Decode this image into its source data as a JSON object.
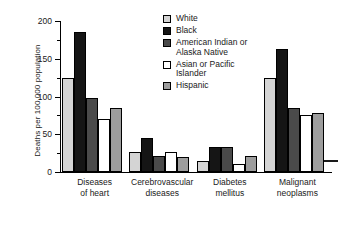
{
  "chart_data": {
    "type": "bar",
    "title": "",
    "xlabel": "",
    "ylabel": "Deaths per 100,000 population",
    "ylim": [
      0,
      200
    ],
    "yticks": [
      0,
      50,
      100,
      150,
      200
    ],
    "ytick_labels": [
      "0",
      "50",
      "100",
      "150",
      "200"
    ],
    "minor_tick_step": 25,
    "grid": false,
    "legend_position": "top-right",
    "categories": [
      "Diseases of heart",
      "Cerebrovascular diseases",
      "Diabetes mellitus",
      "Malignant neoplasms"
    ],
    "category_lines": [
      [
        "Diseases",
        "of heart"
      ],
      [
        "Cerebrovascular",
        "diseases"
      ],
      [
        "Diabetes",
        "mellitus"
      ],
      [
        "Malignant",
        "neoplasms"
      ]
    ],
    "series": [
      {
        "name": "White",
        "color": "#d4d4d4",
        "values": [
          125,
          26,
          15,
          125
        ]
      },
      {
        "name": "Black",
        "color": "#151515",
        "values": [
          185,
          45,
          33,
          163
        ]
      },
      {
        "name": "American Indian or Alaska Native",
        "color": "#4a4a4a",
        "values": [
          98,
          21,
          33,
          85
        ]
      },
      {
        "name": "Asian or Pacific Islander",
        "color": "#ffffff",
        "values": [
          70,
          26,
          10,
          75
        ]
      },
      {
        "name": "Hispanic",
        "color": "#9d9d9d",
        "values": [
          85,
          20,
          21,
          78
        ]
      }
    ]
  },
  "legend": {
    "entries": [
      {
        "label": "White",
        "lines": [
          "White"
        ]
      },
      {
        "label": "Black",
        "lines": [
          "Black"
        ]
      },
      {
        "label": "American Indian or Alaska Native",
        "lines": [
          "American Indian or",
          "Alaska Native"
        ]
      },
      {
        "label": "Asian or Pacific Islander",
        "lines": [
          "Asian or Pacific",
          "Islander"
        ]
      },
      {
        "label": "Hispanic",
        "lines": [
          "Hispanic"
        ]
      }
    ]
  }
}
